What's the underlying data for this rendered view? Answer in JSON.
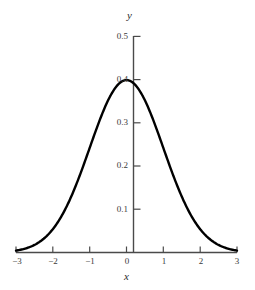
{
  "chart_data": {
    "type": "line",
    "title": "",
    "subtitle": "",
    "xlabel": "x",
    "ylabel": "y",
    "xlim": [
      -3,
      3
    ],
    "ylim": [
      0,
      0.5
    ],
    "grid": false,
    "legend": null,
    "curve_name": "standard-normal-density",
    "xticks": [
      -3,
      -2,
      -1,
      0,
      1,
      2,
      3
    ],
    "xticklabels": [
      "−3",
      "−2",
      "−1",
      "0",
      "1",
      "2",
      "3"
    ],
    "yticks": [
      0.1,
      0.2,
      0.3,
      0.4,
      0.5
    ],
    "yticklabels": [
      "0.1",
      "0.2",
      "0.3",
      "0.4",
      "0.5"
    ],
    "series": [
      {
        "name": "phi(x)",
        "x": [
          -3,
          -2.8,
          -2.6,
          -2.4,
          -2.2,
          -2,
          -1.8,
          -1.6,
          -1.4,
          -1.2,
          -1,
          -0.8,
          -0.6,
          -0.4,
          -0.2,
          0,
          0.2,
          0.4,
          0.6,
          0.8,
          1,
          1.2,
          1.4,
          1.6,
          1.8,
          2,
          2.2,
          2.4,
          2.6,
          2.8,
          3
        ],
        "values": [
          0.0044,
          0.0079,
          0.0136,
          0.0224,
          0.0355,
          0.054,
          0.079,
          0.1109,
          0.1497,
          0.1942,
          0.242,
          0.2897,
          0.3332,
          0.3683,
          0.391,
          0.3989,
          0.391,
          0.3683,
          0.3332,
          0.2897,
          0.242,
          0.1942,
          0.1497,
          0.1109,
          0.079,
          0.054,
          0.0355,
          0.0224,
          0.0136,
          0.0079,
          0.0044
        ],
        "color": "#000000",
        "linewidth": 2.4
      }
    ],
    "peak": {
      "x": 0,
      "y": 0.3989
    },
    "colors": {
      "curve": "#000000",
      "axis": "#4a4a4a",
      "text": "#3a3a3a",
      "background": "#ffffff"
    }
  },
  "axes": {
    "y_axis_name": "y",
    "x_axis_name": "x"
  }
}
